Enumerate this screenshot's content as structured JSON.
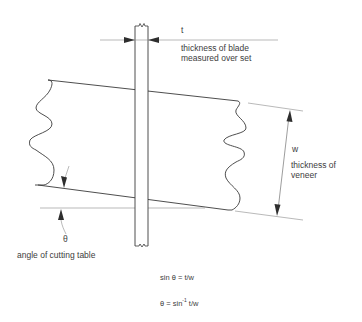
{
  "diagram": {
    "colors": {
      "line": "#3a3a3a",
      "thin_line": "#8a8a8a",
      "background": "#ffffff"
    },
    "blade": {
      "label_symbol": "t",
      "label_line1": "thickness of blade",
      "label_line2": "measured over set"
    },
    "veneer": {
      "label_symbol": "w",
      "label_line1": "thickness of",
      "label_line2": "veneer"
    },
    "table": {
      "label_symbol": "θ",
      "label": "angle of cutting table"
    },
    "formulas": {
      "f1": "sin θ = t/w",
      "f2_prefix": "θ = sin",
      "f2_sup": "-1",
      "f2_suffix": " t/w"
    }
  }
}
